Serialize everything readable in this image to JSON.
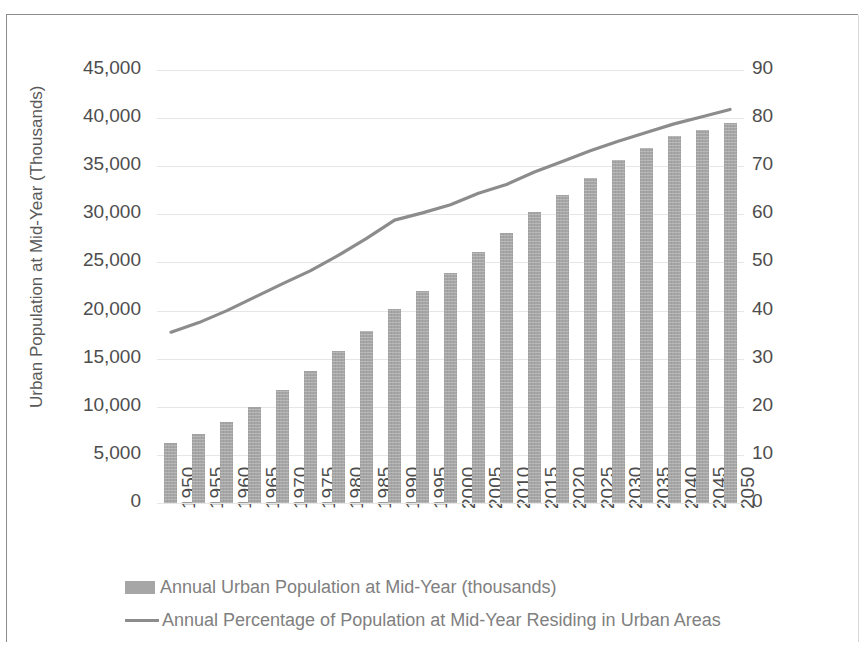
{
  "chart_data": {
    "type": "bar",
    "title": "",
    "xlabel": "",
    "ylabel": "Urban Population at Mid-Year (Thousands)",
    "y2label": "Percentage of Population at Mid-year Residing in Urban Areas (%)",
    "categories": [
      "1950",
      "1955",
      "1960",
      "1965",
      "1970",
      "1975",
      "1980",
      "1985",
      "1990",
      "1995",
      "2000",
      "2005",
      "2010",
      "2015",
      "2020",
      "2025",
      "2030",
      "2035",
      "2040",
      "2045",
      "2050"
    ],
    "ylim": [
      0,
      45000
    ],
    "y2lim": [
      0,
      90
    ],
    "yticks": [
      "0",
      "5,000",
      "10,000",
      "15,000",
      "20,000",
      "25,000",
      "30,000",
      "35,000",
      "40,000",
      "45,000"
    ],
    "y2ticks": [
      "0",
      "10",
      "20",
      "30",
      "40",
      "50",
      "60",
      "70",
      "80",
      "90"
    ],
    "grid": true,
    "legend_position": "bottom",
    "series": [
      {
        "name": "Annual Urban Population at Mid-Year (thousands)",
        "type": "bar",
        "axis": "left",
        "color": "#a6a6a6",
        "values": [
          6240,
          7180,
          8380,
          9980,
          11700,
          13700,
          15800,
          17900,
          20200,
          22000,
          23900,
          26100,
          28100,
          30200,
          32000,
          33800,
          35600,
          36900,
          38100,
          38800,
          39500
        ]
      },
      {
        "name": "Annual Percentage of Population at Mid-Year Residing in Urban Areas",
        "type": "line",
        "axis": "right",
        "color": "#8c8c8c",
        "values": [
          35.5,
          37.5,
          40.0,
          42.8,
          45.6,
          48.3,
          51.5,
          55.0,
          58.8,
          60.3,
          62.0,
          64.4,
          66.2,
          68.8,
          71.0,
          73.2,
          75.2,
          77.0,
          78.8,
          80.3,
          81.8
        ]
      }
    ]
  },
  "legend": {
    "items": [
      {
        "label": "Annual Urban Population at Mid-Year (thousands)",
        "marker": "bar-swatch"
      },
      {
        "label": "Annual Percentage of Population at Mid-Year Residing in Urban Areas",
        "marker": "line-swatch"
      }
    ]
  }
}
